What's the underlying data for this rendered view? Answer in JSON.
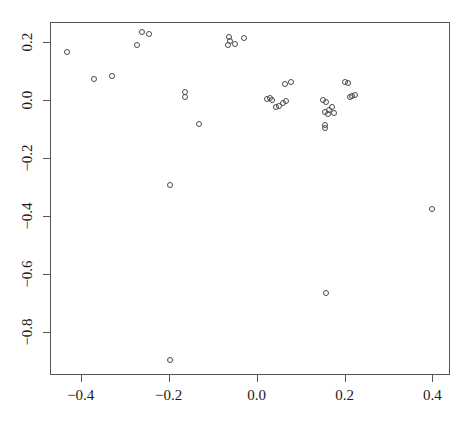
{
  "chart_data": {
    "type": "scatter",
    "title": "",
    "xlabel": "",
    "ylabel": "",
    "xlim": [
      -0.47,
      0.44
    ],
    "ylim": [
      -0.95,
      0.27
    ],
    "xticks": [
      -0.4,
      -0.2,
      0.0,
      0.2,
      0.4
    ],
    "xticklabels": [
      "-0.4",
      "-0.2",
      "0.0",
      "0.2",
      "0.4"
    ],
    "yticks": [
      0.2,
      0.0,
      -0.2,
      -0.4,
      -0.6,
      -0.8
    ],
    "yticklabels": [
      "0.2",
      "0.0",
      "-0.2",
      "-0.4",
      "-0.6",
      "-0.8"
    ],
    "grid": false,
    "legend": null,
    "marker": "open-circle",
    "marker_color": "#4a4a4a",
    "axis_color": "#555555",
    "background": "#ffffff",
    "n_points": 41,
    "x": [
      -0.432,
      -0.37,
      -0.329,
      -0.273,
      -0.26,
      -0.245,
      -0.197,
      -0.197,
      -0.162,
      -0.162,
      -0.13,
      -0.062,
      -0.06,
      -0.066,
      -0.049,
      -0.029,
      0.024,
      0.036,
      0.044,
      0.052,
      0.06,
      0.068,
      0.078,
      0.065,
      0.031,
      0.152,
      0.158,
      0.162,
      0.155,
      0.165,
      0.172,
      0.177,
      0.155,
      0.155,
      0.2,
      0.207,
      0.212,
      0.218,
      0.225,
      0.158,
      0.399
    ],
    "y": [
      0.168,
      0.074,
      0.082,
      0.19,
      0.235,
      0.228,
      -0.295,
      -0.897,
      0.027,
      0.01,
      -0.081,
      0.218,
      0.205,
      0.192,
      0.193,
      0.215,
      0.005,
      0.0,
      -0.025,
      -0.02,
      -0.01,
      -0.003,
      0.064,
      0.057,
      0.008,
      -0.001,
      -0.005,
      -0.048,
      -0.04,
      -0.035,
      -0.025,
      -0.045,
      -0.085,
      -0.095,
      0.062,
      0.06,
      0.012,
      0.015,
      0.018,
      -0.665,
      -0.375
    ]
  },
  "plot": {
    "frame": {
      "left": 50,
      "top": 22,
      "width": 400,
      "height": 353
    }
  }
}
